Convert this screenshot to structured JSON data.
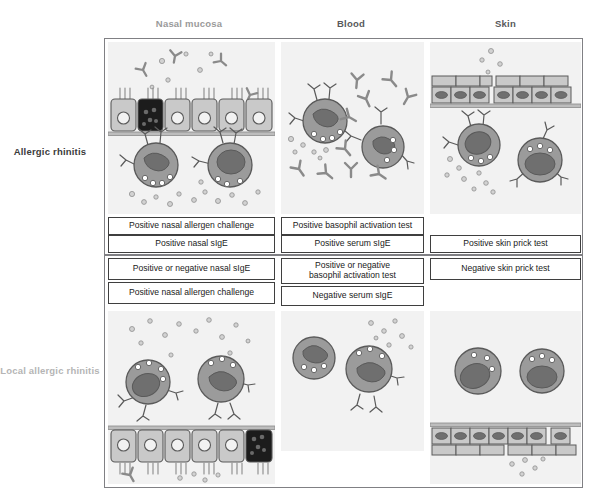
{
  "figure": {
    "type": "diagram"
  },
  "columns": [
    {
      "id": "nasal",
      "label": "Nasal mucosa",
      "color": "#9a9a9a"
    },
    {
      "id": "blood",
      "label": "Blood",
      "color": "#58595b"
    },
    {
      "id": "skin",
      "label": "Skin",
      "color": "#58595b"
    }
  ],
  "rows": [
    {
      "id": "ar",
      "label": "Allergic rhinitis",
      "color": "#3b3b3b"
    },
    {
      "id": "lar",
      "label": "Local allergic rhinitis",
      "color": "#b5b5b5"
    }
  ],
  "results": {
    "allergic_rhinitis": {
      "nasal": [
        "Positive nasal allergen challenge",
        "Positive nasal sIgE"
      ],
      "blood": [
        "Positive basophil activation test",
        "Positive serum sIgE"
      ],
      "skin": [
        "Positive skin prick test"
      ]
    },
    "local_allergic_rhinitis": {
      "nasal": [
        "Positive or negative nasal sIgE",
        "Positive nasal allergen challenge"
      ],
      "blood": [
        "Positive or negative\nbasophil activation test",
        "Negative serum sIgE"
      ],
      "skin": [
        "Negative skin prick test"
      ]
    }
  },
  "illustrations": {
    "ar_nasal": {
      "name": "nasal-mucosa-allergic-rhinitis",
      "epithelium": "ciliated columnar epithelium with one dark goblet cell, cilia facing up",
      "cells": "2 mast cells with surface-bound IgE receptors and granules",
      "free_ige": 4,
      "granules": 18
    },
    "ar_blood": {
      "name": "blood-allergic-rhinitis",
      "cells": "2 basophils with surface-bound IgE",
      "free_ige": 9,
      "granules": 8
    },
    "ar_skin": {
      "name": "skin-allergic-rhinitis",
      "epithelium": "stratified squamous epidermis, flat cells, facing up",
      "cells": "2 mast cells with surface-bound IgE",
      "free_ige": 0,
      "granules": 11
    },
    "lar_nasal": {
      "name": "nasal-mucosa-local-allergic-rhinitis",
      "epithelium": "ciliated columnar epithelium with one dark goblet cell, cilia facing down",
      "cells": "2 mast cells with surface-bound IgE and granules",
      "free_ige": 1,
      "granules": 20
    },
    "lar_blood": {
      "name": "blood-local-allergic-rhinitis",
      "cells": "1 plain basophil, 1 basophil with surface-bound IgE",
      "free_ige": 0,
      "granules": 9
    },
    "lar_skin": {
      "name": "skin-local-allergic-rhinitis",
      "epithelium": "stratified squamous epidermis, flat cells, facing down",
      "cells": "2 plain mast cells without surface IgE",
      "free_ige": 0,
      "granules": 5
    }
  },
  "colors": {
    "panel_background": "#f2f2f2",
    "frame_border": "#808084",
    "cell_body": "#9b9b9b",
    "cell_nucleus": "#6f6f6f",
    "goblet_cell": "#1c1c1c",
    "epithelial_cell": "#c9c9c9",
    "outline": "#5a5a5a",
    "box_border": "#3f3f3f",
    "text": "#1a1a1a"
  }
}
